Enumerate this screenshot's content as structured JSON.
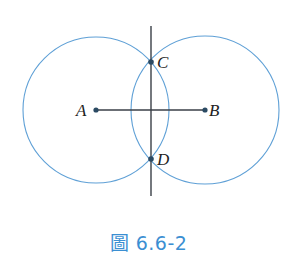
{
  "figure": {
    "caption": "圖 6.6-2",
    "colors": {
      "circle_stroke": "#5fa0d6",
      "line_stroke": "#3a3f47",
      "point_fill": "#2b4a63",
      "label_text": "#222222",
      "caption_text": "#3b8fd2"
    },
    "points": [
      {
        "name": "A",
        "x": 96,
        "y": 110,
        "label_pos": "left"
      },
      {
        "name": "B",
        "x": 205,
        "y": 110,
        "label_pos": "right"
      },
      {
        "name": "C",
        "x": 151,
        "y": 62,
        "label_pos": "upper-right"
      },
      {
        "name": "D",
        "x": 151,
        "y": 159,
        "label_pos": "right"
      }
    ],
    "circles": [
      {
        "center": "A",
        "radius": 73
      },
      {
        "center": "B",
        "radius": 74
      }
    ],
    "segments": [
      {
        "name": "segment-AB",
        "from": "A",
        "to": "B"
      },
      {
        "name": "perpendicular-bisector-CD",
        "x": 151,
        "y1": 26,
        "y2": 196
      }
    ],
    "labels": {
      "A": "A",
      "B": "B",
      "C": "C",
      "D": "D"
    }
  }
}
